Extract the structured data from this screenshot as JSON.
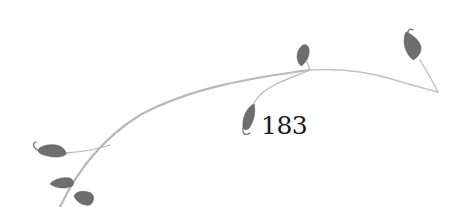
{
  "page": {
    "number": "183"
  },
  "ornament": {
    "icon": "vine-ornament-icon",
    "stem_color": "#b5b5b5",
    "leaf_color": "#6b6b6b"
  }
}
